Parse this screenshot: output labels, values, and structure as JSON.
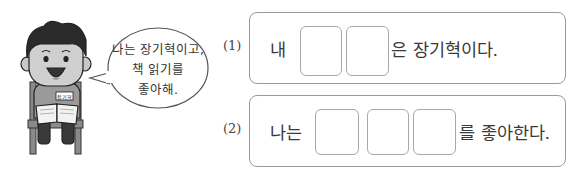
{
  "speech_bubble": {
    "lines": [
      "나는 장기혁이고,",
      "책 읽기를",
      "좋아해."
    ]
  },
  "character": {
    "name_tag": "장기혁",
    "description": "boy sitting on chair reading a book"
  },
  "questions": [
    {
      "number": "(1)",
      "prefix": "내",
      "blank_count": 2,
      "suffix": "은 장기혁이다."
    },
    {
      "number": "(2)",
      "prefix": "나는",
      "blank_count": 3,
      "suffix": "를 좋아한다."
    }
  ],
  "colors": {
    "border": "#9a9a9a",
    "text": "#333333"
  }
}
